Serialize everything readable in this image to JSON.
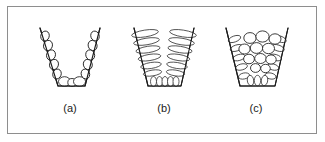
{
  "figure": {
    "border_color": "#8e8e8e",
    "ink_color": "#1b1b1b",
    "background": "#ffffff",
    "width": 325,
    "height": 142
  },
  "panels": [
    {
      "id": "a",
      "label": "(a)",
      "caption_x": 70,
      "caption_y": 112,
      "vessel": {
        "name": "v-shaped-mould",
        "top_left_x": 40,
        "top_right_x": 100,
        "top_y": 28,
        "bottom_left_x": 58,
        "bottom_right_x": 85,
        "bottom_y": 86
      },
      "structure": "chill-columnar-grains-lining-walls",
      "grain_count": 13,
      "grains": [
        {
          "cx": 45.0,
          "cy": 36.0,
          "rx": 5.0,
          "ry": 4.2,
          "rot": -72
        },
        {
          "cx": 48.0,
          "cy": 45.5,
          "rx": 5.2,
          "ry": 4.4,
          "rot": -72
        },
        {
          "cx": 51.0,
          "cy": 55.0,
          "rx": 5.2,
          "ry": 4.4,
          "rot": -72
        },
        {
          "cx": 54.0,
          "cy": 64.5,
          "rx": 5.2,
          "ry": 4.4,
          "rot": -72
        },
        {
          "cx": 57.0,
          "cy": 74.0,
          "rx": 5.0,
          "ry": 4.2,
          "rot": -72
        },
        {
          "cx": 64.5,
          "cy": 81.5,
          "rx": 6.0,
          "ry": 4.8,
          "rot": 0
        },
        {
          "cx": 72.0,
          "cy": 82.5,
          "rx": 4.2,
          "ry": 4.0,
          "rot": 0
        },
        {
          "cx": 79.5,
          "cy": 81.5,
          "rx": 6.0,
          "ry": 4.8,
          "rot": 0
        },
        {
          "cx": 95.0,
          "cy": 36.0,
          "rx": 5.0,
          "ry": 4.2,
          "rot": 72
        },
        {
          "cx": 92.6,
          "cy": 45.5,
          "rx": 5.2,
          "ry": 4.4,
          "rot": 72
        },
        {
          "cx": 90.2,
          "cy": 55.0,
          "rx": 5.2,
          "ry": 4.4,
          "rot": 72
        },
        {
          "cx": 87.8,
          "cy": 64.5,
          "rx": 5.2,
          "ry": 4.4,
          "rot": 72
        },
        {
          "cx": 85.4,
          "cy": 74.0,
          "rx": 5.0,
          "ry": 4.2,
          "rot": 72
        }
      ]
    },
    {
      "id": "b",
      "label": "(b)",
      "caption_x": 164,
      "caption_y": 112,
      "vessel": {
        "name": "trapezoidal-mould",
        "top_left_x": 134,
        "top_right_x": 194,
        "top_y": 28,
        "bottom_left_x": 148,
        "bottom_right_x": 181,
        "bottom_y": 86
      },
      "structure": "elongated-columnar-grains-two-columns",
      "grain_count": 17,
      "grains": [
        {
          "cx": 145.0,
          "cy": 33.5,
          "rx": 13.5,
          "ry": 3.4,
          "rot": -9
        },
        {
          "cx": 146.5,
          "cy": 41.5,
          "rx": 13.0,
          "ry": 3.3,
          "rot": -9
        },
        {
          "cx": 148.0,
          "cy": 49.5,
          "rx": 12.2,
          "ry": 3.2,
          "rot": -9
        },
        {
          "cx": 149.5,
          "cy": 57.5,
          "rx": 11.4,
          "ry": 3.1,
          "rot": -9
        },
        {
          "cx": 151.0,
          "cy": 65.5,
          "rx": 10.4,
          "ry": 3.0,
          "rot": -9
        },
        {
          "cx": 152.5,
          "cy": 73.0,
          "rx": 9.2,
          "ry": 2.9,
          "rot": -9
        },
        {
          "cx": 183.0,
          "cy": 33.5,
          "rx": 13.5,
          "ry": 3.4,
          "rot": 9
        },
        {
          "cx": 181.5,
          "cy": 41.5,
          "rx": 13.0,
          "ry": 3.3,
          "rot": 9
        },
        {
          "cx": 180.0,
          "cy": 49.5,
          "rx": 12.2,
          "ry": 3.2,
          "rot": 9
        },
        {
          "cx": 178.5,
          "cy": 57.5,
          "rx": 11.4,
          "ry": 3.1,
          "rot": 9
        },
        {
          "cx": 177.0,
          "cy": 65.5,
          "rx": 10.4,
          "ry": 3.0,
          "rot": 9
        },
        {
          "cx": 175.5,
          "cy": 73.0,
          "rx": 9.2,
          "ry": 2.9,
          "rot": 9
        },
        {
          "cx": 153.5,
          "cy": 81.5,
          "rx": 3.0,
          "ry": 5.0,
          "rot": 0
        },
        {
          "cx": 159.5,
          "cy": 81.5,
          "rx": 3.0,
          "ry": 5.0,
          "rot": 0
        },
        {
          "cx": 165.0,
          "cy": 81.5,
          "rx": 3.0,
          "ry": 5.0,
          "rot": 0
        },
        {
          "cx": 170.5,
          "cy": 81.5,
          "rx": 3.0,
          "ry": 5.0,
          "rot": 0
        },
        {
          "cx": 176.0,
          "cy": 81.5,
          "rx": 3.0,
          "ry": 5.0,
          "rot": 0
        }
      ]
    },
    {
      "id": "c",
      "label": "(c)",
      "caption_x": 256,
      "caption_y": 112,
      "vessel": {
        "name": "trapezoidal-mould",
        "top_left_x": 226,
        "top_right_x": 288,
        "top_y": 28,
        "bottom_left_x": 240,
        "bottom_right_x": 275,
        "bottom_y": 86
      },
      "structure": "equiaxed-plus-columnar-mixed-grains",
      "grain_count": 24,
      "equiaxed_grains": [
        {
          "cx": 250.0,
          "cy": 38.0,
          "rx": 6.2,
          "ry": 5.4
        },
        {
          "cx": 262.5,
          "cy": 36.5,
          "rx": 6.6,
          "ry": 5.6
        },
        {
          "cx": 275.0,
          "cy": 39.0,
          "rx": 6.0,
          "ry": 5.2
        },
        {
          "cx": 244.5,
          "cy": 49.0,
          "rx": 5.6,
          "ry": 5.0
        },
        {
          "cx": 256.5,
          "cy": 48.0,
          "rx": 6.2,
          "ry": 5.4
        },
        {
          "cx": 268.5,
          "cy": 48.5,
          "rx": 6.0,
          "ry": 5.2
        },
        {
          "cx": 249.0,
          "cy": 59.0,
          "rx": 5.4,
          "ry": 4.8
        },
        {
          "cx": 260.5,
          "cy": 58.5,
          "rx": 5.8,
          "ry": 5.0
        },
        {
          "cx": 271.0,
          "cy": 59.5,
          "rx": 5.2,
          "ry": 4.6
        },
        {
          "cx": 255.5,
          "cy": 68.0,
          "rx": 5.0,
          "ry": 4.4
        },
        {
          "cx": 265.5,
          "cy": 68.5,
          "rx": 4.8,
          "ry": 4.2
        }
      ],
      "columnar_grains": [
        {
          "cx": 234.5,
          "cy": 39.0,
          "rx": 6.5,
          "ry": 3.0,
          "rot": -20
        },
        {
          "cx": 236.5,
          "cy": 48.0,
          "rx": 6.5,
          "ry": 3.0,
          "rot": -18
        },
        {
          "cx": 239.0,
          "cy": 57.5,
          "rx": 6.2,
          "ry": 3.0,
          "rot": -16
        },
        {
          "cx": 241.5,
          "cy": 67.0,
          "rx": 6.0,
          "ry": 3.0,
          "rot": -14
        },
        {
          "cx": 244.0,
          "cy": 76.0,
          "rx": 5.6,
          "ry": 3.0,
          "rot": -12
        },
        {
          "cx": 280.0,
          "cy": 39.0,
          "rx": 6.5,
          "ry": 3.0,
          "rot": 20
        },
        {
          "cx": 278.0,
          "cy": 48.0,
          "rx": 6.5,
          "ry": 3.0,
          "rot": 18
        },
        {
          "cx": 275.5,
          "cy": 57.5,
          "rx": 6.2,
          "ry": 3.0,
          "rot": 16
        },
        {
          "cx": 273.0,
          "cy": 67.0,
          "rx": 6.0,
          "ry": 3.0,
          "rot": 14
        },
        {
          "cx": 270.5,
          "cy": 76.0,
          "rx": 5.6,
          "ry": 3.0,
          "rot": 12
        },
        {
          "cx": 250.5,
          "cy": 80.5,
          "rx": 3.2,
          "ry": 5.2,
          "rot": -8
        },
        {
          "cx": 257.5,
          "cy": 80.5,
          "rx": 3.2,
          "ry": 5.2,
          "rot": 0
        },
        {
          "cx": 264.5,
          "cy": 80.5,
          "rx": 3.2,
          "ry": 5.2,
          "rot": 8
        }
      ]
    }
  ]
}
